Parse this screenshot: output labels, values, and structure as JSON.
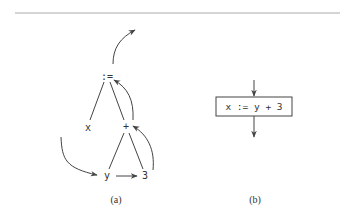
{
  "figure": {
    "panel_a": {
      "caption": "(a)",
      "nodes": {
        "assign": ":=",
        "x": "x",
        "plus": "+",
        "y": "y",
        "three": "3"
      }
    },
    "panel_b": {
      "caption": "(b)",
      "statement": "x := y + 3"
    }
  },
  "colors": {
    "stroke": "#444444",
    "rule": "#aaaaaa",
    "text": "#333333"
  }
}
